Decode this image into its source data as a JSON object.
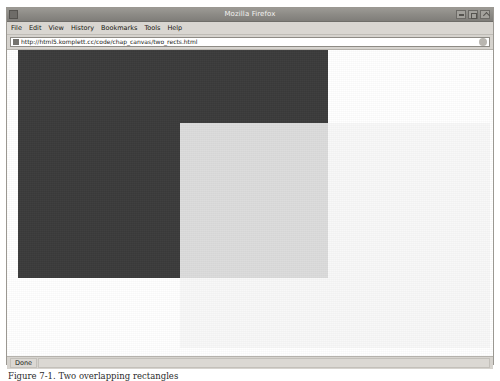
{
  "window": {
    "title": "Mozilla Firefox",
    "icon": "firefox-icon",
    "buttons": [
      {
        "name": "minimize",
        "label": "Minimize"
      },
      {
        "name": "maximize",
        "label": "Maximize"
      },
      {
        "name": "close",
        "label": "Close"
      }
    ]
  },
  "menubar": {
    "items": [
      {
        "label": "File"
      },
      {
        "label": "Edit"
      },
      {
        "label": "View"
      },
      {
        "label": "History"
      },
      {
        "label": "Bookmarks"
      },
      {
        "label": "Tools"
      },
      {
        "label": "Help"
      }
    ]
  },
  "navbar": {
    "url_value": "http://html5.komplett.cc/code/chap_canvas/two_rects.html",
    "url_placeholder": "Search or enter address",
    "favicon": "page-icon",
    "go_icon": "go-arrow-icon"
  },
  "statusbar": {
    "status_text": "Done"
  },
  "caption": {
    "text": "Figure 7-1. Two overlapping rectangles"
  },
  "colors": {
    "dark_rect": "#3b3b3b",
    "light_rect": "#f7f7f7",
    "page_background": "#ffffff",
    "chrome": "#d6d3ce",
    "titlebar": "#8e8c87"
  },
  "canvas": {
    "description": "HTML5 canvas with two overlapping filled rectangles",
    "shapes": [
      {
        "name": "dark-rectangle",
        "fill": "#3b3b3b",
        "x": 11,
        "y": 0,
        "width": 310,
        "height": 228
      },
      {
        "name": "light-rectangle",
        "fill": "#f7f7f7",
        "alpha": 0.86,
        "x": 173,
        "y": 73,
        "width": 310,
        "height": 225
      }
    ]
  }
}
